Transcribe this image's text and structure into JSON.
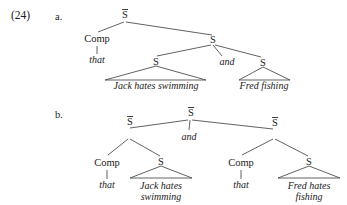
{
  "example": {
    "number": "(24)",
    "sub_a": "a.",
    "sub_b": "b."
  },
  "labels": {
    "s_bar": "S",
    "s": "S",
    "comp": "Comp"
  },
  "tree_a": {
    "root": "S",
    "comp": "Comp",
    "comp_terminal": "that",
    "coord_node": "S",
    "conjunction": "and",
    "left_conjunct_node": "S",
    "left_conjunct_text": "Jack hates swimming",
    "right_conjunct_node": "S",
    "right_conjunct_text": "Fred fishing"
  },
  "tree_b": {
    "root": "S",
    "conjunction": "and",
    "left_sbar": "S",
    "left_comp": "Comp",
    "left_comp_terminal": "that",
    "left_s": "S",
    "left_s_text_line1": "Jack hates",
    "left_s_text_line2": "swimming",
    "right_sbar": "S",
    "right_comp": "Comp",
    "right_comp_terminal": "that",
    "right_s": "S",
    "right_s_text_line1": "Fred hates",
    "right_s_text_line2": "fishing"
  },
  "colors": {
    "ink": "#1a1a1a",
    "line": "#3a3a3a",
    "page": "#ffffff"
  }
}
